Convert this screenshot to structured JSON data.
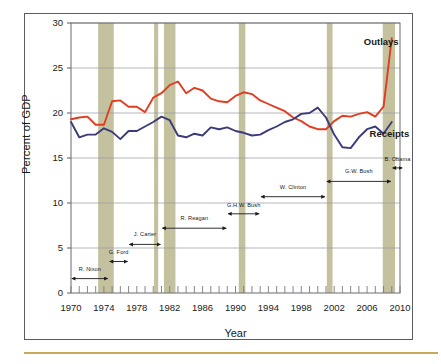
{
  "chart_data": {
    "type": "line",
    "title": "",
    "xlabel": "Year",
    "ylabel": "Percent of GDP",
    "xlim": [
      1970,
      2010
    ],
    "ylim": [
      0,
      30
    ],
    "grid": true,
    "legend_position": "inline-labels",
    "y_ticks": [
      "0",
      "5",
      "10",
      "15",
      "20",
      "25",
      "30"
    ],
    "x_ticks": [
      "1970",
      "1974",
      "1978",
      "1982",
      "1986",
      "1990",
      "1994",
      "1998",
      "2002",
      "2006",
      "2010"
    ],
    "x": [
      1970,
      1971,
      1972,
      1973,
      1974,
      1975,
      1976,
      1977,
      1978,
      1979,
      1980,
      1981,
      1982,
      1983,
      1984,
      1985,
      1986,
      1987,
      1988,
      1989,
      1990,
      1991,
      1992,
      1993,
      1994,
      1995,
      1996,
      1997,
      1998,
      1999,
      2000,
      2001,
      2002,
      2003,
      2004,
      2005,
      2006,
      2007,
      2008,
      2009
    ],
    "series": [
      {
        "name": "Outlays",
        "color": "#e03c20",
        "values": [
          19.3,
          19.5,
          19.6,
          18.7,
          18.7,
          21.3,
          21.4,
          20.7,
          20.7,
          20.1,
          21.7,
          22.2,
          23.1,
          23.5,
          22.2,
          22.8,
          22.5,
          21.6,
          21.3,
          21.2,
          21.9,
          22.3,
          22.1,
          21.4,
          21.0,
          20.6,
          20.2,
          19.5,
          19.1,
          18.5,
          18.2,
          18.2,
          19.1,
          19.7,
          19.6,
          19.9,
          20.1,
          19.6,
          20.7,
          28.3
        ]
      },
      {
        "name": "Receipts",
        "color": "#3b3b7a",
        "values": [
          19.0,
          17.3,
          17.6,
          17.6,
          18.3,
          17.9,
          17.1,
          18.0,
          18.0,
          18.5,
          19.0,
          19.6,
          19.2,
          17.5,
          17.3,
          17.7,
          17.5,
          18.4,
          18.2,
          18.4,
          18.0,
          17.8,
          17.5,
          17.6,
          18.1,
          18.5,
          19.0,
          19.3,
          19.9,
          20.0,
          20.6,
          19.5,
          17.6,
          16.2,
          16.1,
          17.3,
          18.2,
          18.5,
          17.7,
          19.0
        ]
      }
    ],
    "series_labels": [
      {
        "name": "outlays-label",
        "text": "Outlays",
        "year": 2005.6,
        "value": 27.8
      },
      {
        "name": "receipts-label",
        "text": "Receipts",
        "year": 2006.3,
        "value": 17.6
      }
    ],
    "recession_bands": [
      {
        "start": 1973.3,
        "end": 1975.2
      },
      {
        "start": 1980.1,
        "end": 1980.6
      },
      {
        "start": 1981.3,
        "end": 1982.7
      },
      {
        "start": 1990.4,
        "end": 1991.2
      },
      {
        "start": 2001.1,
        "end": 2001.8
      },
      {
        "start": 2007.9,
        "end": 2009.4
      }
    ],
    "band_color": "#b7b489",
    "annotations": [
      {
        "name": "annotation-r-nixon",
        "text": "R. Nixon",
        "start": 1970.0,
        "end": 1974.6,
        "value": 1.6,
        "label_value": 2.6
      },
      {
        "name": "annotation-g-ford",
        "text": "G. Ford",
        "start": 1974.6,
        "end": 1977.0,
        "value": 3.5,
        "label_value": 4.5
      },
      {
        "name": "annotation-j-carter",
        "text": "J. Carter",
        "start": 1977.0,
        "end": 1981.0,
        "value": 5.4,
        "label_value": 6.4
      },
      {
        "name": "annotation-r-reagan",
        "text": "R. Reagan",
        "start": 1981.0,
        "end": 1989.0,
        "value": 7.2,
        "label_value": 8.2
      },
      {
        "name": "annotation-ghw-bush",
        "text": "G.H.W. Bush",
        "start": 1989.0,
        "end": 1993.0,
        "value": 8.8,
        "label_value": 9.7
      },
      {
        "name": "annotation-w-clinton",
        "text": "W. Clinton",
        "start": 1993.0,
        "end": 2001.0,
        "value": 10.7,
        "label_value": 11.7
      },
      {
        "name": "annotation-gw-bush",
        "text": "G.W. Bush",
        "start": 2001.0,
        "end": 2009.0,
        "value": 12.4,
        "label_value": 13.4
      },
      {
        "name": "annotation-b-obama",
        "text": "B. Obama",
        "start": 2009.0,
        "end": 2010.4,
        "value": 13.9,
        "label_value": 14.8
      }
    ]
  }
}
